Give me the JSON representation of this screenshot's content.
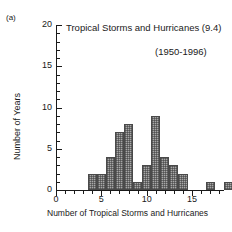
{
  "panel": {
    "label": "(a)"
  },
  "chart_data": {
    "type": "bar",
    "title": "Tropical Storms and Hurricanes (9.4)",
    "annotation": "(1950-1996)",
    "xlabel": "Number of Tropical Storms and Hurricanes",
    "ylabel": "Number of Years",
    "xlim": [
      0,
      19.5
    ],
    "ylim": [
      0,
      20
    ],
    "grid": false,
    "legend_position": "none",
    "mean": 9.4,
    "period": "1950-1996",
    "total_years": 47,
    "x_ticks_major": [
      0,
      5,
      10,
      15
    ],
    "x_tick_labels": [
      "0",
      "5",
      "10",
      "15"
    ],
    "x_tick_interval_minor": 1,
    "y_ticks_major": [
      0,
      5,
      10,
      15,
      20
    ],
    "y_tick_labels": [
      "0",
      "5",
      "10",
      "15",
      "20"
    ],
    "y_tick_interval_minor": 1,
    "categories": [
      4,
      5,
      6,
      7,
      8,
      9,
      10,
      11,
      12,
      13,
      14,
      17,
      19
    ],
    "values": [
      2,
      2,
      4,
      7,
      8,
      1,
      3,
      9,
      4,
      3,
      2,
      1,
      1
    ]
  }
}
